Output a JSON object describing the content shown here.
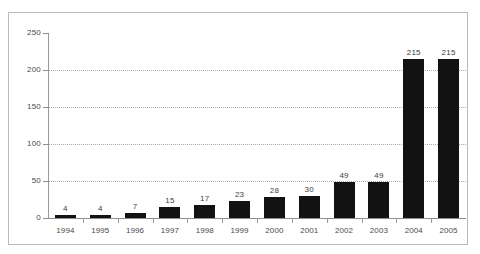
{
  "chart_data": {
    "type": "bar",
    "title": "",
    "subtitle": "",
    "xlabel": "",
    "ylabel": "",
    "categories": [
      "1994",
      "1995",
      "1996",
      "1997",
      "1998",
      "1999",
      "2000",
      "2001",
      "2002",
      "2003",
      "2004",
      "2005"
    ],
    "values": [
      4,
      4,
      7,
      15,
      17,
      23,
      28,
      30,
      49,
      49,
      215,
      215
    ],
    "data_labels": [
      "4",
      "4",
      "7",
      "15",
      "17",
      "23",
      "28",
      "30",
      "49",
      "49",
      "215",
      "215"
    ],
    "ylim": [
      0,
      250
    ],
    "y_ticks": [
      0,
      50,
      100,
      150,
      200,
      250
    ],
    "y_tick_labels": [
      "0",
      "50",
      "100",
      "150",
      "200",
      "250"
    ],
    "grid": true,
    "grid_axis": "y",
    "legend": null,
    "legend_position": "none",
    "series": [
      {
        "name": "",
        "values": [
          4,
          4,
          7,
          15,
          17,
          23,
          28,
          30,
          49,
          49,
          215,
          215
        ],
        "color": "#121212"
      }
    ],
    "colors": {
      "bar": "#121212",
      "grid": "#a8a8a8",
      "axis": "#8e8e8e",
      "text": "#4a4a4a",
      "frame": "#b9b9b9",
      "background": "#ffffff"
    }
  }
}
